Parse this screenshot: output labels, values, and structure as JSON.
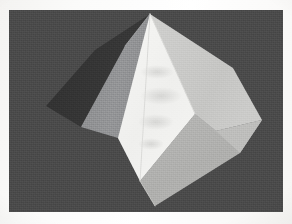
{
  "figure": {
    "subject_name": "polyhedron",
    "render_style": "flat-shaded faceted solid",
    "medium_note": "grainy scanned halftone print",
    "background_color": "#4a4a4a",
    "page_margin_color": "#fbfaf8",
    "canvas": {
      "x": 9,
      "y": 10,
      "width": 274,
      "height": 202
    },
    "vertices": {
      "apex_top": [
        141,
        4
      ],
      "apex_top_right": [
        146,
        3
      ],
      "left_outer": [
        37,
        96
      ],
      "left_upper_ridge": [
        86,
        40
      ],
      "left_lower": [
        72,
        117
      ],
      "front_left": [
        109,
        128
      ],
      "front_bottom": [
        131,
        171
      ],
      "bottom_outer": [
        146,
        196
      ],
      "right_outer": [
        253,
        110
      ],
      "right_upper": [
        224,
        58
      ],
      "right_lower": [
        231,
        143
      ],
      "front_right": [
        186,
        104
      ],
      "mid_right": [
        207,
        121
      ]
    },
    "facets": [
      {
        "name": "upper-left-shadow-sliver",
        "fill": "#343434",
        "shading": "darkest, edge-on sliver",
        "points": "86,40 141,4 116,36 72,117 37,96"
      },
      {
        "name": "left-face",
        "fill": "#8f9092",
        "shading": "mid gray",
        "points": "116,36 141,4 131,171 109,128 72,117"
      },
      {
        "name": "front-highlight-face",
        "fill": "#f2f2f0",
        "shading": "brightest, facing light",
        "points": "141,4 186,104 131,171 109,128"
      },
      {
        "name": "upper-right-face",
        "fill": "#c9c9c7",
        "shading": "light gray",
        "points": "141,4 224,58 253,110 207,121 186,104"
      },
      {
        "name": "lower-right-face",
        "fill": "#b2b2b0",
        "shading": "light-mid gray",
        "points": "186,104 207,121 253,110 231,143 146,196 131,171"
      },
      {
        "name": "right-bevel-facet",
        "fill": "#bdbdbb",
        "shading": "narrow bevel strip",
        "points": "207,121 253,110 231,143"
      }
    ],
    "edge_highlights": [
      {
        "name": "apex-ridge-edge",
        "from": [
          141,
          4
        ],
        "to": [
          131,
          171
        ],
        "color": "#d8d8d6"
      },
      {
        "name": "front-right-ridge-edge",
        "from": [
          141,
          4
        ],
        "to": [
          186,
          104
        ],
        "color": "#e4e4e2"
      },
      {
        "name": "bottom-ridge-edge",
        "from": [
          131,
          171
        ],
        "to": [
          146,
          196
        ],
        "color": "#cfcfcd"
      }
    ],
    "artifacts": [
      {
        "name": "smudge-upper",
        "region": "front-highlight-face",
        "note": "faint gray print mottling"
      },
      {
        "name": "smudge-center",
        "region": "front-highlight-face",
        "note": "faint gray print mottling"
      },
      {
        "name": "smudge-lower",
        "region": "front-highlight-face",
        "note": "faint gray print mottling"
      }
    ]
  }
}
